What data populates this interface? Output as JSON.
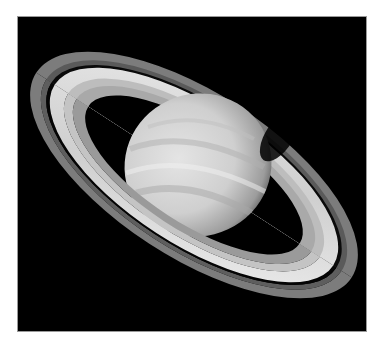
{
  "caption": {
    "text": "— — — — — — — — — — — — — — — —"
  },
  "image": {
    "subject": "Saturn with rings",
    "background_color": "#000000",
    "border_color": "#9a9a9a",
    "planet_color": "#d6d6d6",
    "ring_color": "#e6e6e6",
    "outer_ring_color": "#8a8a8a"
  }
}
